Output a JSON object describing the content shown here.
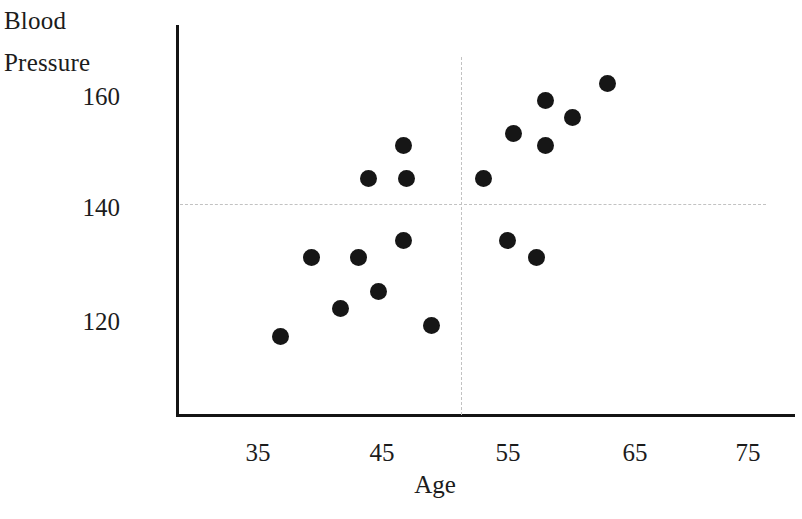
{
  "chart_data": {
    "type": "scatter",
    "title": "",
    "xlabel": "Age",
    "ylabel": "Blood Pressure",
    "ylabel_lines": [
      "Blood",
      "Pressure"
    ],
    "xticks": [
      35,
      45,
      55,
      65,
      75
    ],
    "xtick_labels": [
      "35",
      "45",
      "55",
      "65",
      "75"
    ],
    "yticks": [
      120,
      140,
      160
    ],
    "ytick_labels": [
      "120",
      "140",
      "160"
    ],
    "xlim": [
      30.5,
      78
    ],
    "ylim": [
      112,
      167
    ],
    "grid": false,
    "marker_color": "#161616",
    "marker_size_px": 17,
    "axis_color": "#141414",
    "reference_lines": [
      {
        "orientation": "horizontal",
        "value": 140.5,
        "axis": "y",
        "style": "dashed",
        "color": "#c2c2c2"
      },
      {
        "orientation": "vertical",
        "value": 51.3,
        "axis": "x",
        "style": "dashed",
        "color": "#c2c2c2"
      }
    ],
    "points": [
      {
        "x": 36.8,
        "y": 117
      },
      {
        "x": 39.3,
        "y": 131
      },
      {
        "x": 41.6,
        "y": 122
      },
      {
        "x": 43.1,
        "y": 131
      },
      {
        "x": 43.9,
        "y": 145
      },
      {
        "x": 44.7,
        "y": 125
      },
      {
        "x": 46.7,
        "y": 151
      },
      {
        "x": 46.7,
        "y": 134
      },
      {
        "x": 46.9,
        "y": 145
      },
      {
        "x": 48.9,
        "y": 119
      },
      {
        "x": 53.1,
        "y": 145
      },
      {
        "x": 55.0,
        "y": 134
      },
      {
        "x": 55.5,
        "y": 153
      },
      {
        "x": 57.4,
        "y": 131
      },
      {
        "x": 58.1,
        "y": 159
      },
      {
        "x": 58.1,
        "y": 151
      },
      {
        "x": 60.3,
        "y": 156
      },
      {
        "x": 63.1,
        "y": 162
      }
    ],
    "n_points": 18,
    "x_values": [
      36.8,
      39.3,
      41.6,
      43.1,
      43.9,
      44.7,
      46.7,
      46.7,
      46.9,
      48.9,
      53.1,
      55.0,
      55.5,
      57.4,
      58.1,
      58.1,
      60.3,
      63.1
    ],
    "y_values": [
      117,
      131,
      122,
      131,
      145,
      125,
      151,
      134,
      145,
      119,
      145,
      134,
      153,
      131,
      159,
      151,
      156,
      162
    ]
  },
  "geometry": {
    "x_axis_pixel_origin": 258,
    "x_pixels_per_unit": 12.45,
    "x_origin_value": 35,
    "y_axis_pixel_origin": 207,
    "y_pixels_per_unit": 5.625,
    "y_origin_value": 140
  }
}
